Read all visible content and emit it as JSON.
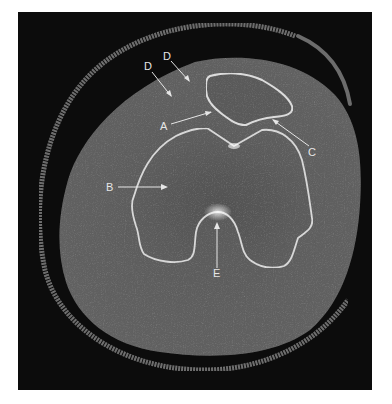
{
  "figure": {
    "type": "axial CT image of knee",
    "background_color": "#0c0c0c",
    "soft_tissue_color": "#5e5e5e",
    "bone_cortex_color": "#d8d8d8",
    "skin_ring_color": "#6a6a6a",
    "label_color": "#e6e6e6"
  },
  "labels": [
    {
      "id": "D1",
      "text": "D",
      "x": 148,
      "y": 68,
      "arrow_to": [
        172,
        97
      ]
    },
    {
      "id": "D2",
      "text": "D",
      "x": 167,
      "y": 57,
      "arrow_to": [
        190,
        82
      ]
    },
    {
      "id": "A",
      "text": "A",
      "x": 163,
      "y": 129,
      "arrow_to": [
        212,
        112
      ]
    },
    {
      "id": "C",
      "text": "C",
      "x": 311,
      "y": 154,
      "arrow_to": [
        272,
        119
      ]
    },
    {
      "id": "B",
      "text": "B",
      "x": 109,
      "y": 191,
      "arrow_to": [
        167,
        187
      ]
    },
    {
      "id": "E",
      "text": "E",
      "x": 213,
      "y": 276,
      "arrow_to": [
        217,
        223
      ]
    }
  ]
}
